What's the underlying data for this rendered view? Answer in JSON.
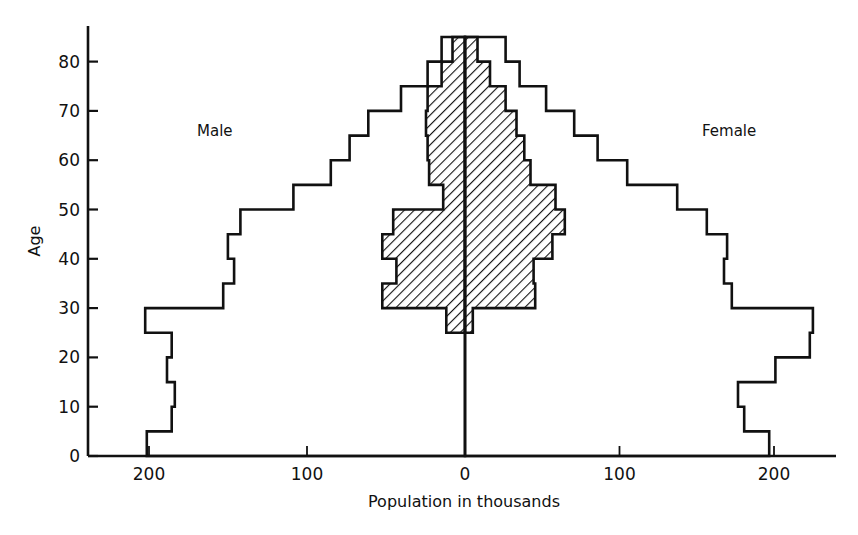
{
  "chart_data": {
    "type": "bar",
    "subtype": "population-pyramid",
    "title": "",
    "xlabel": "Population in thousands",
    "ylabel": "Age",
    "xlim": [
      -240,
      240
    ],
    "ylim": [
      0,
      85
    ],
    "x_ticks": [
      {
        "value": -200,
        "label": "200"
      },
      {
        "value": -100,
        "label": "100"
      },
      {
        "value": 0,
        "label": "0"
      },
      {
        "value": 100,
        "label": "100"
      },
      {
        "value": 200,
        "label": "200"
      }
    ],
    "y_ticks": [
      0,
      10,
      20,
      30,
      40,
      50,
      60,
      70,
      80
    ],
    "grid": false,
    "legend": null,
    "annotations": [
      {
        "text": "Male",
        "side": "left"
      },
      {
        "text": "Female",
        "side": "right"
      }
    ],
    "age_groups": [
      "0-5",
      "5-10",
      "10-15",
      "15-20",
      "20-25",
      "25-30",
      "30-35",
      "35-40",
      "40-45",
      "45-50",
      "50-55",
      "55-60",
      "60-65",
      "65-70",
      "70-75",
      "75-80",
      "80-85"
    ],
    "age_bin_starts": [
      0,
      5,
      10,
      15,
      20,
      25,
      30,
      35,
      40,
      45,
      50,
      55,
      60,
      65,
      70,
      75,
      80
    ],
    "series": [
      {
        "name": "Male (total, outline)",
        "side": "left",
        "style": "outline",
        "values": [
          204,
          188,
          186,
          191,
          188,
          205,
          155,
          148,
          152,
          144,
          110,
          86,
          74,
          62,
          41,
          24,
          15
        ]
      },
      {
        "name": "Female (total, outline)",
        "side": "right",
        "style": "outline",
        "values": [
          195,
          179,
          175,
          199,
          221,
          223,
          171,
          166,
          168,
          155,
          136,
          104,
          85,
          70,
          52,
          35,
          26
        ]
      },
      {
        "name": "Male (hatched subgroup)",
        "side": "left",
        "style": "hatched",
        "values": [
          0,
          0,
          0,
          0,
          0,
          12,
          53,
          44,
          53,
          46,
          14,
          23,
          24,
          25,
          24,
          15,
          8
        ]
      },
      {
        "name": "Female (hatched subgroup)",
        "side": "right",
        "style": "hatched",
        "values": [
          0,
          0,
          0,
          0,
          0,
          5,
          45,
          44,
          56,
          64,
          58,
          42,
          38,
          33,
          26,
          16,
          8
        ]
      }
    ]
  },
  "labels": {
    "male": "Male",
    "female": "Female",
    "xlabel": "Population in thousands",
    "ylabel": "Age"
  }
}
